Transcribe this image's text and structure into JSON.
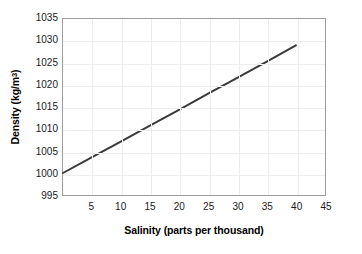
{
  "chart_data": {
    "type": "line",
    "title": "",
    "xlabel": "Salinity (parts per thousand)",
    "ylabel": "Density (kg/m3)",
    "ylabel_base": "Density (kg/m",
    "ylabel_sup": "3",
    "ylabel_tail": ")",
    "xlim": [
      0,
      45
    ],
    "ylim": [
      995,
      1035
    ],
    "xticks": [
      5,
      10,
      15,
      20,
      25,
      30,
      35,
      40,
      45
    ],
    "yticks": [
      995,
      1000,
      1005,
      1010,
      1015,
      1020,
      1025,
      1030,
      1035
    ],
    "xtick_labels": [
      "5",
      "10",
      "15",
      "20",
      "25",
      "30",
      "35",
      "40",
      "45"
    ],
    "ytick_labels": [
      "995",
      "1000",
      "1005",
      "1010",
      "1015",
      "1020",
      "1025",
      "1030",
      "1035"
    ],
    "grid": true,
    "grid_color": "#ededee",
    "frame_color": "#9c9c9c",
    "legend": false,
    "series": [
      {
        "name": "Density vs salinity",
        "color": "#3a3a3c",
        "line_width": 2,
        "x": [
          0,
          5,
          10,
          15,
          20,
          25,
          30,
          35,
          40
        ],
        "values": [
          1000.0,
          1003.6,
          1007.2,
          1010.8,
          1014.4,
          1018.1,
          1021.7,
          1025.3,
          1029.0
        ]
      }
    ]
  }
}
